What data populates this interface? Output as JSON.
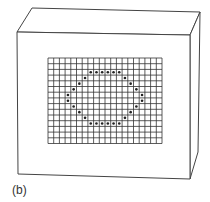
{
  "figure": {
    "label": "(b)",
    "colors": {
      "background": "#ffffff",
      "line": "#444444",
      "grid": "#333333",
      "dot": "#222222"
    },
    "box": {
      "front": [
        [
          17,
          32
        ],
        [
          190,
          35
        ],
        [
          190,
          179
        ],
        [
          18,
          174
        ]
      ],
      "top": [
        [
          17,
          32
        ],
        [
          32,
          8
        ],
        [
          200,
          12
        ],
        [
          190,
          35
        ]
      ],
      "side": [
        [
          190,
          35
        ],
        [
          200,
          12
        ],
        [
          198,
          152
        ],
        [
          190,
          179
        ]
      ]
    },
    "grid": {
      "x": 48,
      "y": 58,
      "columns": 20,
      "rows": 15,
      "cell": 5.7
    },
    "dots": [
      [
        7,
        2
      ],
      [
        8,
        2
      ],
      [
        9,
        2
      ],
      [
        10,
        2
      ],
      [
        11,
        2
      ],
      [
        12,
        2
      ],
      [
        13,
        3
      ],
      [
        14,
        4
      ],
      [
        15,
        5
      ],
      [
        16,
        6
      ],
      [
        16,
        7
      ],
      [
        15,
        8
      ],
      [
        14,
        9
      ],
      [
        13,
        10
      ],
      [
        12,
        11
      ],
      [
        11,
        11
      ],
      [
        10,
        11
      ],
      [
        9,
        11
      ],
      [
        8,
        11
      ],
      [
        7,
        11
      ],
      [
        6,
        10
      ],
      [
        5,
        9
      ],
      [
        4,
        8
      ],
      [
        3,
        7
      ],
      [
        3,
        6
      ],
      [
        4,
        5
      ],
      [
        5,
        4
      ],
      [
        6,
        3
      ]
    ]
  }
}
